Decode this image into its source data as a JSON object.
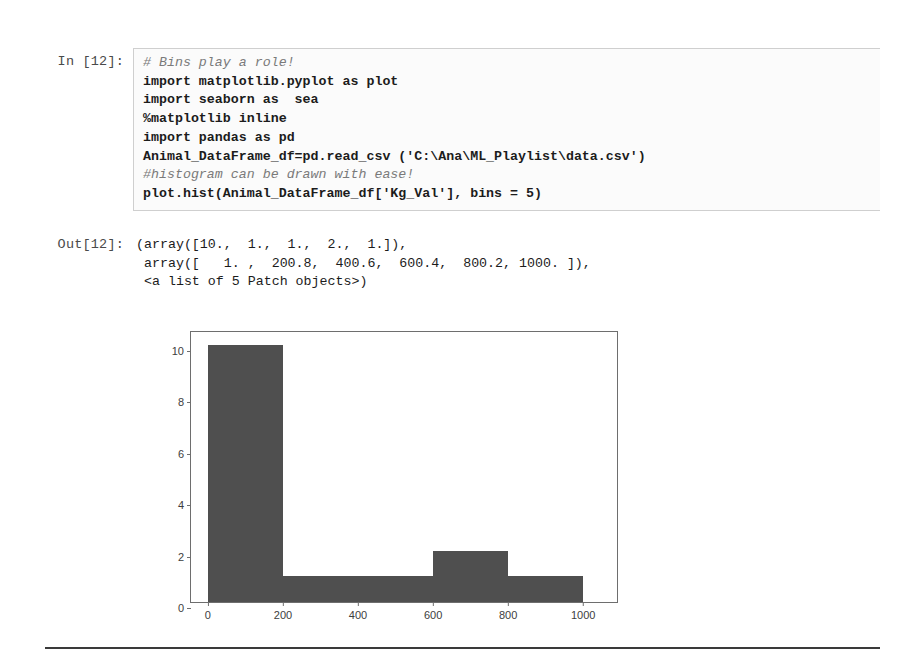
{
  "cell": {
    "input_prompt": "In [12]:",
    "output_prompt": "Out[12]:",
    "code_lines": [
      {
        "text": "# Bins play a role!",
        "comment": true
      },
      {
        "text": "import matplotlib.pyplot as plot",
        "comment": false
      },
      {
        "text": "import seaborn as  sea",
        "comment": false
      },
      {
        "text": "%matplotlib inline",
        "comment": false
      },
      {
        "text": "import pandas as pd",
        "comment": false
      },
      {
        "text": "Animal_DataFrame_df=pd.read_csv ('C:\\Ana\\ML_Playlist\\data.csv')",
        "comment": false
      },
      {
        "text": "#histogram can be drawn with ease!",
        "comment": true
      },
      {
        "text": "plot.hist(Animal_DataFrame_df['Kg_Val'], bins = 5)",
        "comment": false
      }
    ],
    "output_lines": [
      "(array([10.,  1.,  1.,  2.,  1.]),",
      " array([   1. ,  200.8,  400.6,  600.4,  800.2, 1000. ]),",
      " <a list of 5 Patch objects>)"
    ]
  },
  "chart_data": {
    "type": "bar",
    "title": "",
    "xlabel": "",
    "ylabel": "",
    "xlim": [
      -45,
      1090
    ],
    "ylim": [
      0,
      10.5
    ],
    "grid": false,
    "legend": null,
    "bin_edges": [
      1.0,
      200.8,
      400.6,
      600.4,
      800.2,
      1000.0
    ],
    "values": [
      10,
      1,
      1,
      2,
      1
    ],
    "bar_color": "#4f4f4f",
    "xticks": [
      "0",
      "200",
      "400",
      "600",
      "800",
      "1000"
    ],
    "xtick_values": [
      0,
      200,
      400,
      600,
      800,
      1000
    ],
    "yticks": [
      "0",
      "2",
      "4",
      "6",
      "8",
      "10"
    ],
    "ytick_values": [
      0,
      2,
      4,
      6,
      8,
      10
    ]
  }
}
